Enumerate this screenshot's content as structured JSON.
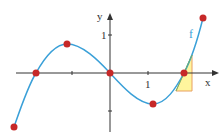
{
  "diagram": {
    "function_label": "f",
    "x_axis_label": "x",
    "y_axis_label": "y",
    "x_tick_label": "1",
    "y_tick_label": "1",
    "colors": {
      "curve": "#3aa0d8",
      "points": "#c62828",
      "triangle_fill": "#fff59d",
      "triangle_stroke": "#e8a060",
      "axes": "#333333"
    },
    "points": [
      {
        "name": "start-point",
        "x": 14,
        "y": 127
      },
      {
        "name": "root-left",
        "x": 36,
        "y": 73
      },
      {
        "name": "local-max",
        "x": 67,
        "y": 44
      },
      {
        "name": "root-origin",
        "x": 110,
        "y": 73
      },
      {
        "name": "local-min",
        "x": 153,
        "y": 104
      },
      {
        "name": "root-right",
        "x": 184,
        "y": 73
      },
      {
        "name": "end-point",
        "x": 203,
        "y": 18
      }
    ]
  }
}
